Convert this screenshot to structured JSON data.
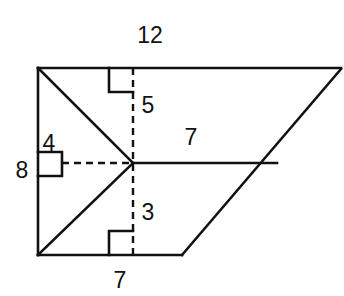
{
  "figure": {
    "kind": "composite-polygon-area-diagram",
    "stroke_color": "#111111",
    "fill_color": "#ffffff",
    "background_color": "#ffffff",
    "solid_stroke_width": 2.6,
    "dashed_stroke_width": 2.4,
    "dash_pattern": "7 5",
    "right_angle_mark_size": 24,
    "vertices": {
      "top_left": {
        "x": 38,
        "y": 68
      },
      "top_right": {
        "x": 341,
        "y": 68
      },
      "bottom_left": {
        "x": 38,
        "y": 255
      },
      "bottom_right": {
        "x": 182,
        "y": 255
      },
      "center": {
        "x": 133,
        "y": 163
      },
      "right_mid": {
        "x": 276,
        "y": 163
      },
      "slant_top": {
        "x": 341,
        "y": 70
      }
    },
    "solid_segments": [
      {
        "name": "top-edge",
        "from": "top_left",
        "to": "top_right"
      },
      {
        "name": "left-edge",
        "from": "top_left",
        "to": "bottom_left"
      },
      {
        "name": "bottom-edge",
        "from": "bottom_left",
        "to": "bottom_right"
      },
      {
        "name": "right-slant-edge",
        "from": "bottom_right",
        "to": "slant_top"
      },
      {
        "name": "upper-diagonal",
        "from": "top_left",
        "to": "center"
      },
      {
        "name": "lower-diagonal",
        "from": "bottom_left",
        "to": "center"
      },
      {
        "name": "center-horizontal",
        "from": "center",
        "to": "right_mid"
      }
    ],
    "dashed_segments": [
      {
        "name": "vertical-altitude",
        "from": {
          "x": 133,
          "y": 68
        },
        "to": {
          "x": 133,
          "y": 255
        }
      },
      {
        "name": "horizontal-altitude",
        "from": {
          "x": 62,
          "y": 163
        },
        "to": {
          "x": 133,
          "y": 163
        }
      }
    ],
    "right_angle_marks": [
      {
        "name": "top-right-angle",
        "x": 109,
        "y": 68,
        "orient": "down-left"
      },
      {
        "name": "bottom-right-angle",
        "x": 109,
        "y": 231,
        "orient": "up-left"
      },
      {
        "name": "left-right-angle",
        "x": 38,
        "y": 152,
        "orient": "right-down"
      }
    ],
    "labels": [
      {
        "name": "label-top-12",
        "text": "12",
        "x": 150,
        "y": 35
      },
      {
        "name": "label-altitude-5",
        "text": "5",
        "x": 148,
        "y": 105
      },
      {
        "name": "label-left-4",
        "text": "4",
        "x": 49,
        "y": 143
      },
      {
        "name": "label-left-8",
        "text": "8",
        "x": 22,
        "y": 170
      },
      {
        "name": "label-middle-7",
        "text": "7",
        "x": 191,
        "y": 137
      },
      {
        "name": "label-altitude-3",
        "text": "3",
        "x": 148,
        "y": 212
      },
      {
        "name": "label-bottom-7",
        "text": "7",
        "x": 120,
        "y": 280
      }
    ]
  }
}
